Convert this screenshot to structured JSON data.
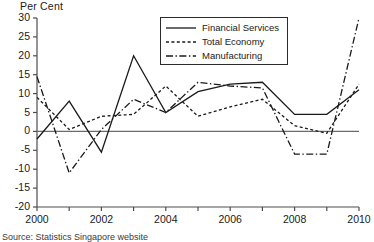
{
  "axis": {
    "ylabel": "Per Cent",
    "yticks": [
      30,
      25,
      20,
      15,
      10,
      5,
      0,
      -5,
      -10,
      -15,
      -20
    ],
    "xticks_labeled": [
      2000,
      2002,
      2004,
      2006,
      2008,
      2010
    ],
    "xticks_all": [
      2000,
      2001,
      2002,
      2003,
      2004,
      2005,
      2006,
      2007,
      2008,
      2009,
      2010
    ]
  },
  "legend": {
    "position": "top-right",
    "items": [
      {
        "label": "Financial Services",
        "style": "solid"
      },
      {
        "label": "Total Economy",
        "style": "dotted"
      },
      {
        "label": "Manufacturing",
        "style": "dash-dot"
      }
    ]
  },
  "source": {
    "text": "Source: Statistics Singapore website"
  },
  "colors": {
    "line": "#1a1a1a",
    "axis": "#4d4d4d",
    "zero_line": "#6b6b6b"
  },
  "chart_data": {
    "type": "line",
    "title": "",
    "xlabel": "",
    "ylabel": "Per Cent",
    "xlim": [
      2000,
      2010
    ],
    "ylim": [
      -20,
      30
    ],
    "grid": false,
    "legend_position": "top-right",
    "x": [
      2000,
      2001,
      2002,
      2003,
      2004,
      2005,
      2006,
      2007,
      2008,
      2009,
      2010
    ],
    "series": [
      {
        "name": "Financial Services",
        "style": "solid",
        "values": [
          -2,
          8,
          -5.5,
          20,
          5,
          10.5,
          12.5,
          13,
          4.5,
          4.5,
          11
        ]
      },
      {
        "name": "Total Economy",
        "style": "dotted",
        "values": [
          9,
          0.5,
          4,
          4.5,
          12,
          4,
          6.5,
          8.5,
          1.5,
          -0.5,
          12.5
        ]
      },
      {
        "name": "Manufacturing",
        "style": "dash-dot",
        "values": [
          14.5,
          -11,
          0.5,
          8.5,
          5,
          13,
          12,
          11.5,
          -6,
          -6,
          30
        ]
      }
    ]
  }
}
